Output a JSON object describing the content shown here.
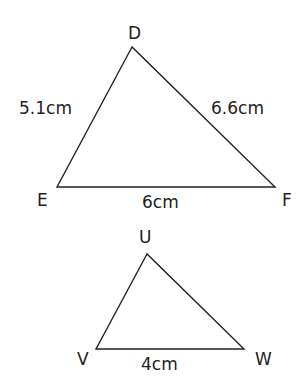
{
  "triangles": [
    {
      "name": "DEF",
      "vertices": {
        "D": {
          "label": "D",
          "x": 132,
          "y": 47
        },
        "E": {
          "label": "E",
          "x": 57,
          "y": 187
        },
        "F": {
          "label": "F",
          "x": 275,
          "y": 187
        }
      },
      "sides": {
        "DE": "5.1cm",
        "DF": "6.6cm",
        "EF": "6cm"
      }
    },
    {
      "name": "UVW",
      "vertices": {
        "U": {
          "label": "U",
          "x": 147,
          "y": 254
        },
        "V": {
          "label": "V",
          "x": 96,
          "y": 349
        },
        "W": {
          "label": "W",
          "x": 244,
          "y": 349
        }
      },
      "sides": {
        "VW": "4cm"
      }
    }
  ],
  "colors": {
    "line": "#222222",
    "text": "#222222",
    "background": "#ffffff"
  }
}
